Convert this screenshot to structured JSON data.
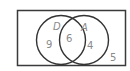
{
  "diagram": {
    "type": "venn",
    "sets": [
      {
        "name": "D",
        "only_count": "9"
      },
      {
        "name": "A",
        "only_count": "4"
      }
    ],
    "intersection": {
      "sets": [
        "D",
        "A"
      ],
      "count": "6"
    },
    "outside": {
      "count": "5"
    },
    "colors": {
      "stroke": "#3a3a3a",
      "text": "#8a8a8a",
      "background": "#ffffff"
    }
  }
}
